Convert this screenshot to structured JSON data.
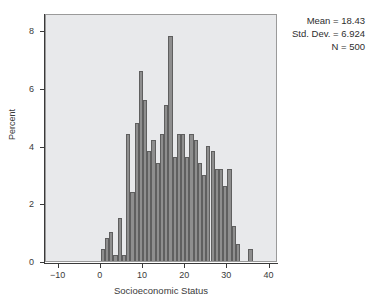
{
  "chart_data": {
    "type": "bar",
    "title": "",
    "subtitle": "",
    "xlabel": "Socioeconomic Status",
    "ylabel": "Percent",
    "xlim": [
      -13,
      42
    ],
    "ylim": [
      0,
      8.6
    ],
    "xticks": [
      -10,
      0,
      10,
      20,
      30,
      40
    ],
    "xtick_labels": [
      "-10",
      "0",
      "10",
      "20",
      "30",
      "40"
    ],
    "yticks": [
      0,
      2,
      4,
      6,
      8
    ],
    "ytick_labels": [
      "0",
      "2",
      "4",
      "6",
      "8"
    ],
    "grid": false,
    "legend": "none",
    "bin_width": 1,
    "bar_color": "#8e8e8e",
    "bar_edge_color": "#5f5f5f",
    "panel_color": "#e8e9eb",
    "categories": [
      0,
      1,
      2,
      3,
      4,
      5,
      6,
      7,
      8,
      9,
      10,
      11,
      12,
      13,
      14,
      15,
      16,
      17,
      18,
      19,
      20,
      21,
      22,
      23,
      24,
      25,
      26,
      27,
      28,
      29,
      30,
      31,
      32,
      35
    ],
    "values": [
      0.4,
      0.8,
      1.0,
      0.2,
      1.5,
      0.2,
      4.4,
      2.4,
      4.8,
      6.6,
      5.6,
      3.8,
      4.2,
      3.4,
      4.4,
      5.4,
      7.8,
      3.6,
      4.4,
      4.4,
      3.6,
      4.4,
      4.2,
      3.4,
      3.0,
      4.0,
      3.8,
      3.2,
      3.2,
      2.6,
      3.2,
      1.2,
      0.6,
      0.4
    ],
    "annotations": {
      "mean_label": "Mean = 18.43",
      "std_label": "Std. Dev. = 6.924",
      "n_label": "N = 500"
    }
  }
}
